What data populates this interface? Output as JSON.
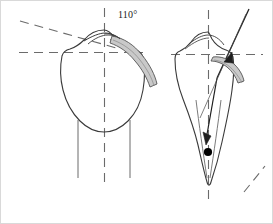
{
  "figure": {
    "name": "proximal-humerus-angle-diagram",
    "background_color": "#ffffff",
    "width": 273,
    "height": 224,
    "border_color": "#d8d8d8",
    "stroke_color": "#3a3a3a",
    "dash_color": "#6b6b6b",
    "band_fill": "#c9c9c9",
    "band_stroke": "#5a5a5a",
    "marker_color": "#000000"
  },
  "labels": {
    "angle_left": "110°"
  },
  "panels": [
    {
      "id": "left-panel",
      "name": "anterior-view",
      "vertical_axis": {
        "x": 104,
        "y1": 8,
        "y2": 182
      },
      "horizontal_axis": {
        "y": 52,
        "x1": 20,
        "x2": 142
      },
      "oblique_axis": {
        "x1": 22,
        "y1": 22,
        "x2": 118,
        "y2": 48
      },
      "has_angle_label": true,
      "has_band": true,
      "has_arrow": false,
      "has_marker": false
    },
    {
      "id": "right-panel",
      "name": "lateral-view",
      "vertical_axis": {
        "x": 208,
        "y1": 10,
        "y2": 205
      },
      "horizontal_axis": {
        "y": 54,
        "x1": 172,
        "x2": 262
      },
      "oblique_axis": {
        "x1": 245,
        "y1": 188,
        "x2": 262,
        "y2": 168
      },
      "has_angle_label": false,
      "has_band": true,
      "has_arrow": true,
      "has_marker": true,
      "marker_point": {
        "x": 208,
        "y": 152
      }
    }
  ],
  "icons": {
    "marker": "filled-dot",
    "arrow": "down-left-arrow"
  }
}
